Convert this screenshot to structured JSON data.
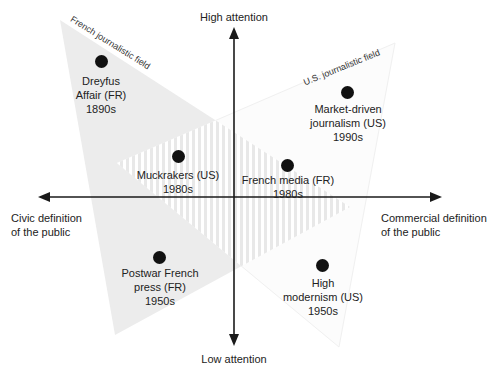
{
  "axes": {
    "top_label": "High attention",
    "bottom_label": "Low attention",
    "left_label_line1": "Civic definition",
    "left_label_line2": "of the public",
    "right_label_line1": "Commercial definition",
    "right_label_line2": "of the public"
  },
  "fields": {
    "french": {
      "label": "French journalistic field",
      "fill": "#ececec"
    },
    "us": {
      "label": "U.S. journalistic field",
      "fill": "#fbfbfb"
    },
    "overlap_hatch": "#e6e6e6"
  },
  "points": [
    {
      "line1": "Dreyfus",
      "line2": "Affair (FR)",
      "line3": "1890s"
    },
    {
      "line1": "Market-driven",
      "line2": "journalism (US)",
      "line3": "1990s"
    },
    {
      "line1": "Muckrakers (US)",
      "line2": "1980s",
      "line3": ""
    },
    {
      "line1": "French media (FR)",
      "line2": "1980s",
      "line3": ""
    },
    {
      "line1": "Postwar French",
      "line2": "press (FR)",
      "line3": "1950s"
    },
    {
      "line1": "High",
      "line2": "modernism (US)",
      "line3": "1950s"
    }
  ],
  "colors": {
    "axis": "#1a1a1a",
    "dot": "#111111"
  }
}
